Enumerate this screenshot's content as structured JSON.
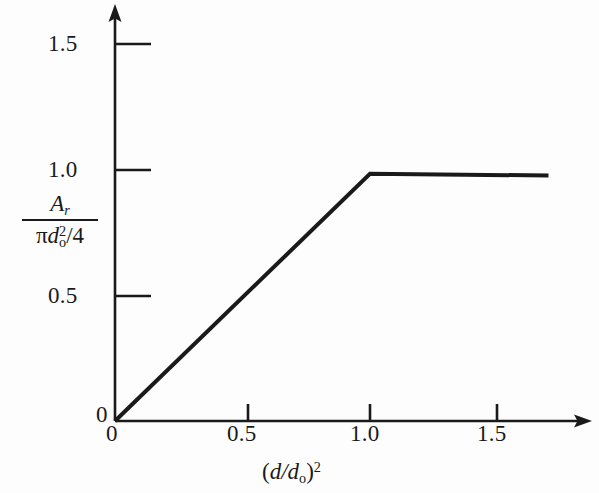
{
  "chart_data": {
    "type": "line",
    "title": "",
    "subtitle": "",
    "xlabel": "(d/d_o)^2",
    "ylabel": "A_r / (pi d_o^2 / 4)",
    "xlim": [
      0,
      1.78
    ],
    "ylim": [
      0,
      1.64
    ],
    "grid": false,
    "legend": null,
    "x_ticks": [
      {
        "value": 0,
        "label": "0"
      },
      {
        "value": 0.5,
        "label": "0.5"
      },
      {
        "value": 1.0,
        "label": "1.0"
      },
      {
        "value": 1.5,
        "label": "1.5"
      }
    ],
    "y_ticks": [
      {
        "value": 0,
        "label": "0"
      },
      {
        "value": 0.5,
        "label": "0.5"
      },
      {
        "value": 1.0,
        "label": "1.0"
      },
      {
        "value": 1.5,
        "label": "1.5"
      }
    ],
    "series": [
      {
        "name": "relief area ratio",
        "x": [
          0.0,
          1.0,
          1.7
        ],
        "values": [
          0.0,
          0.985,
          0.978
        ],
        "color": "#1a1a1a",
        "line_width": 4,
        "description": "linear ramp from origin to (1.0, 1.0), then flat plateau"
      }
    ],
    "annotations": [],
    "axis_style": "arrow-ended open axes, outward ticks"
  },
  "axis_labels": {
    "y_numerator": "A",
    "y_numerator_sub": "r",
    "y_denominator_pi": "π",
    "y_denominator_d": "d",
    "y_denominator_sub": "o",
    "y_denominator_sup": "2",
    "y_denominator_tail": "/4",
    "x_open": "(",
    "x_d1": "d",
    "x_slash": "/",
    "x_d2": "d",
    "x_sub": "o",
    "x_close": ")",
    "x_sup": "2"
  },
  "ticks": {
    "y": {
      "t15": "1.5",
      "t10": "1.0",
      "t05": "0.5"
    },
    "origin": "0",
    "origin_x": "0",
    "x": {
      "t05": "0.5",
      "t10": "1.0",
      "t15": "1.5"
    }
  },
  "colors": {
    "ink": "#1a1a1a",
    "background": "#fdfdfd",
    "curve": "#1a1a1a"
  }
}
